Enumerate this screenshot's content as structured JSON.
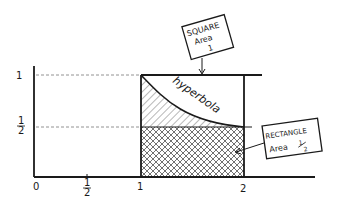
{
  "diagram": {
    "type": "hand-drawn area diagram",
    "axes": {
      "x_ticks": [
        {
          "label": "0",
          "value": 0
        },
        {
          "label_num": "1",
          "label_den": "2",
          "value": 0.5
        },
        {
          "label": "1",
          "value": 1
        },
        {
          "label": "2",
          "value": 2
        }
      ],
      "y_ticks": [
        {
          "label": "1",
          "value": 1
        },
        {
          "label_num": "1",
          "label_den": "2",
          "value": 0.5
        }
      ]
    },
    "curve_label": "hyperbola",
    "callouts": {
      "square": {
        "line1": "SQUARE",
        "line2": "Area",
        "line3": "1"
      },
      "rectangle": {
        "line1": "RECTANGLE",
        "line2": "Area",
        "frac_num": "1",
        "frac_den": "2"
      }
    },
    "colors": {
      "ink": "#1a1a1a",
      "guide": "#777777",
      "background": "#ffffff"
    }
  }
}
